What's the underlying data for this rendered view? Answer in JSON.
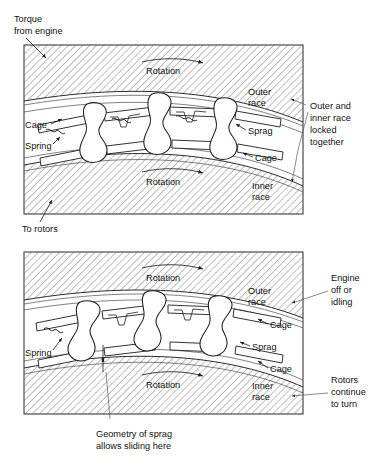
{
  "figure": {
    "type": "technical-diagram",
    "panels": [
      {
        "id": "top",
        "state": "engaged",
        "external_labels": {
          "top_left": "Torque\nfrom engine",
          "top_left_line1": "Torque",
          "top_left_line2": "from engine",
          "bottom_left": "To rotors",
          "right_line1": "Outer and",
          "right_line2": "inner race",
          "right_line3": "locked",
          "right_line4": "together"
        },
        "internal_labels": {
          "rotation_outer": "Rotation",
          "rotation_inner": "Rotation",
          "outer_race_l1": "Outer",
          "outer_race_l2": "race",
          "inner_race_l1": "Inner",
          "inner_race_l2": "race",
          "cage_left": "Cage",
          "spring_left": "Spring",
          "sprag_right": "Sprag",
          "cage_right": "Cage"
        }
      },
      {
        "id": "bottom",
        "state": "overrunning",
        "external_labels": {
          "right_a_l1": "Engine",
          "right_a_l2": "off or",
          "right_a_l3": "idling",
          "right_b_l1": "Rotors",
          "right_b_l2": "continue",
          "right_b_l3": "to turn",
          "caption_l1": "Geometry of sprag",
          "caption_l2": "allows sliding here"
        },
        "internal_labels": {
          "rotation_outer": "Rotation",
          "rotation_inner": "Rotation",
          "outer_race_l1": "Outer",
          "outer_race_l2": "race",
          "inner_race_l1": "Inner",
          "inner_race_l2": "race",
          "cage_upper": "Cage",
          "sprag_right": "Sprag",
          "cage_lower": "Cage",
          "spring_left": "Spring"
        }
      }
    ],
    "colors": {
      "ink": "#1d1d1d",
      "hatch": "#6a6a6a",
      "leader": "#5a5a5a",
      "frame": "#3a3a3a",
      "background": "#ffffff"
    }
  }
}
